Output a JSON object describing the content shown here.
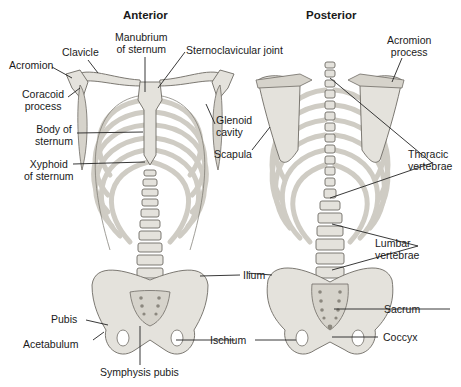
{
  "diagram": {
    "views": [
      {
        "title": "Anterior",
        "labels": [
          {
            "id": "acromion",
            "text": "Acromion"
          },
          {
            "id": "clavicle",
            "text": "Clavicle"
          },
          {
            "id": "manubrium",
            "line1": "Manubrium",
            "line2": "of sternum"
          },
          {
            "id": "sternoclavicular",
            "text": "Sternoclavicular joint"
          },
          {
            "id": "coracoid",
            "line1": "Coracoid",
            "line2": "process"
          },
          {
            "id": "glenoid",
            "line1": "Glenoid",
            "line2": "cavity"
          },
          {
            "id": "body-sternum",
            "line1": "Body of",
            "line2": "sternum"
          },
          {
            "id": "xyphoid",
            "line1": "Xyphoid",
            "line2": "of sternum"
          },
          {
            "id": "ilium",
            "text": "Ilium"
          },
          {
            "id": "pubis",
            "text": "Pubis"
          },
          {
            "id": "acetabulum",
            "text": "Acetabulum"
          },
          {
            "id": "ischium",
            "text": "Ischium"
          },
          {
            "id": "symphysis",
            "text": "Symphysis pubis"
          }
        ]
      },
      {
        "title": "Posterior",
        "labels": [
          {
            "id": "acromion-process",
            "line1": "Acromion",
            "line2": "process"
          },
          {
            "id": "scapula",
            "text": "Scapula"
          },
          {
            "id": "thoracic",
            "line1": "Thoracic",
            "line2": "vertebrae"
          },
          {
            "id": "lumbar",
            "line1": "Lumbar",
            "line2": "vertebrae"
          },
          {
            "id": "sacrum",
            "text": "Sacrum"
          },
          {
            "id": "coccyx",
            "text": "Coccyx"
          }
        ]
      }
    ],
    "colors": {
      "background": "#ffffff",
      "bone": "#e4e2dc",
      "outline": "#6e6b64",
      "leader": "#222222"
    }
  }
}
